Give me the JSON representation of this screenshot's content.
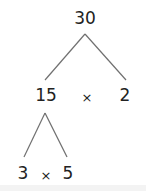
{
  "diagram": {
    "type": "factor-tree",
    "root": "30",
    "level1": {
      "left": "15",
      "operator": "×",
      "right": "2"
    },
    "level2": {
      "left": "3",
      "operator": "×",
      "right": "5"
    },
    "line_color": "#707070",
    "text_color": "#222222"
  }
}
